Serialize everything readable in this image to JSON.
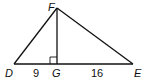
{
  "diagram": {
    "type": "right-triangle-altitude",
    "vertices": {
      "D": {
        "label": "D",
        "x": 14,
        "y": 64
      },
      "E": {
        "label": "E",
        "x": 133,
        "y": 64
      },
      "F": {
        "label": "F",
        "x": 57,
        "y": 8
      },
      "G": {
        "label": "G",
        "x": 57,
        "y": 64
      }
    },
    "segments": [
      {
        "from": "D",
        "to": "F"
      },
      {
        "from": "F",
        "to": "E"
      },
      {
        "from": "D",
        "to": "E"
      },
      {
        "from": "F",
        "to": "G"
      }
    ],
    "right_angle_at": "G",
    "measurements": {
      "DG": "9",
      "GE": "16"
    },
    "stroke_color": "#111111"
  }
}
